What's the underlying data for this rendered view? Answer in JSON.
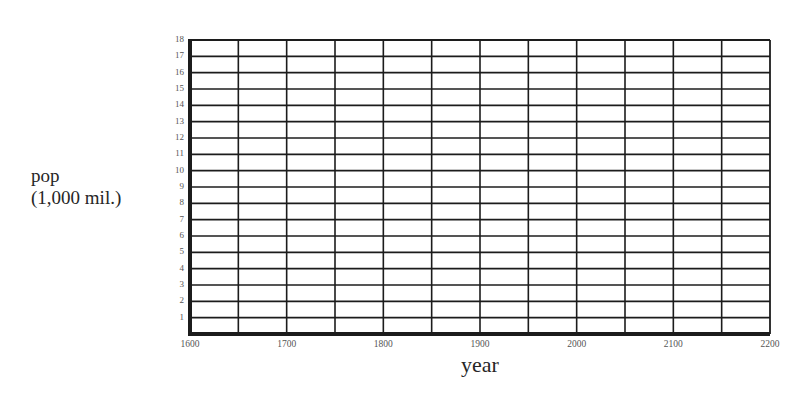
{
  "page": {
    "cutoff_top_text": ""
  },
  "chart_data": {
    "type": "line",
    "title": "",
    "xlabel": "year",
    "ylabel_line1": "pop",
    "ylabel_line2": "(1,000 mil.)",
    "xlim": [
      1600,
      2200
    ],
    "ylim": [
      0,
      18
    ],
    "x_ticks": [
      "1600",
      "1700",
      "1800",
      "1900",
      "2000",
      "2100",
      "2200"
    ],
    "y_ticks": [
      "1",
      "2",
      "3",
      "4",
      "5",
      "6",
      "7",
      "8",
      "9",
      "10",
      "11",
      "12",
      "13",
      "14",
      "15",
      "16",
      "17",
      "18"
    ],
    "x_gridlines_every": 50,
    "y_gridlines_every": 1,
    "grid": true,
    "legend": "none",
    "series": [],
    "note": "Blank graph-paper worksheet; no data plotted"
  },
  "colors": {
    "grid": "#1c1c1c",
    "text": "#2a2a2a",
    "tick_text": "#555555",
    "background": "#ffffff"
  }
}
